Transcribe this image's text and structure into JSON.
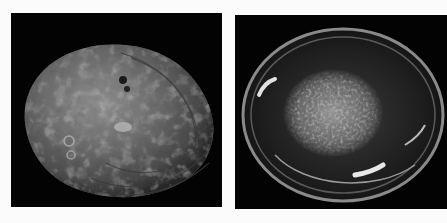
{
  "image": {
    "description": "Two photographs of an abalone shell on black backgrounds",
    "background": "#fbfbfb",
    "panels": [
      {
        "id": "left",
        "subject": "abalone shell exterior (dorsal view)",
        "background": "#030303"
      },
      {
        "id": "right",
        "subject": "abalone shell interior (nacre / mother-of-pearl)",
        "background": "#030303"
      }
    ]
  }
}
